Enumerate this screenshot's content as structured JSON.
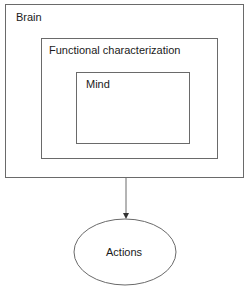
{
  "diagram": {
    "type": "nested-containment-with-arrow",
    "nodes": [
      {
        "id": "brain",
        "label": "Brain",
        "shape": "rectangle",
        "contains": [
          "functional"
        ]
      },
      {
        "id": "functional",
        "label": "Functional characterization",
        "shape": "rectangle",
        "contains": [
          "mind"
        ]
      },
      {
        "id": "mind",
        "label": "Mind",
        "shape": "rectangle"
      },
      {
        "id": "actions",
        "label": "Actions",
        "shape": "ellipse"
      }
    ],
    "edges": [
      {
        "from": "brain",
        "to": "actions",
        "style": "arrow"
      }
    ],
    "colors": {
      "stroke": "#6a6a6a",
      "text": "#1a1a1a",
      "background": "#ffffff"
    }
  }
}
